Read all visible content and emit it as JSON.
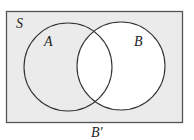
{
  "diagram": {
    "type": "venn",
    "universal_set_label": "S",
    "sets": [
      {
        "label": "A",
        "cx": 68,
        "cy": 67,
        "r": 44
      },
      {
        "label": "B",
        "cx": 121,
        "cy": 66,
        "r": 44
      }
    ],
    "shaded_region": "complement of B",
    "caption": "B′",
    "colors": {
      "shade": "#ebebeb",
      "unshaded": "#ffffff",
      "stroke": "#333333",
      "border": "#555555"
    }
  }
}
